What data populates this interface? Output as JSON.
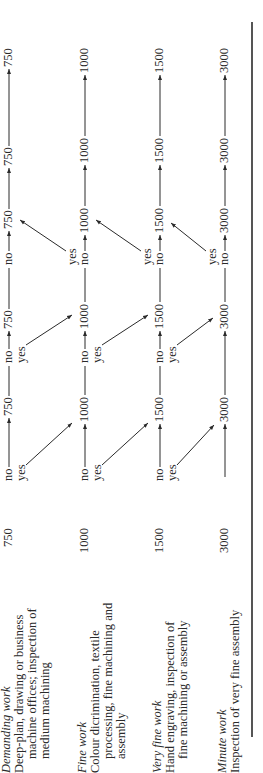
{
  "rows": [
    {
      "title": "Demanding work",
      "desc": [
        "Deep-plan, drawing or business",
        "machine offices; inspection of",
        "medium machining"
      ],
      "lux": "750",
      "labels": {
        "c1_no": "no",
        "c1_yes": "yes",
        "v2": "750",
        "c2_no": "no",
        "c2_yes": "yes",
        "v3": "750",
        "c3_no": "no",
        "v4": "750",
        "v5": "750",
        "v6": "750"
      }
    },
    {
      "title": "Fine work",
      "desc": [
        "Colour dicrimination, textile",
        "processing, fine machining and",
        "assembly"
      ],
      "lux": "1000",
      "labels": {
        "c1_no": "no",
        "c1_yes": "yes",
        "v2": "1000",
        "c2_no": "no",
        "c2_yes": "yes",
        "v3": "1000",
        "c3_yes": "yes",
        "c3_no": "no",
        "v4": "1000",
        "v5": "1000",
        "v6": "1000"
      }
    },
    {
      "title": "Very fine work",
      "desc": [
        "Hand engraving, inspection of",
        "fine machining or assembly"
      ],
      "lux": "1500",
      "labels": {
        "c1_no": "no",
        "c1_yes": "yes",
        "v2": "1500",
        "c2_no": "no",
        "c2_yes": "yes",
        "v3": "1500",
        "c3_yes": "yes",
        "c3_no": "no",
        "v4": "1500",
        "v5": "1500",
        "v6": "1500"
      }
    },
    {
      "title": "Minute work",
      "desc": [
        "Inspection of very fine assembly"
      ],
      "lux": "3000",
      "labels": {
        "v2": "3000",
        "v3": "3000",
        "c3_yes": "yes",
        "c3_no": "no",
        "v4": "3000",
        "v5": "3000",
        "v6": "3000"
      }
    }
  ]
}
